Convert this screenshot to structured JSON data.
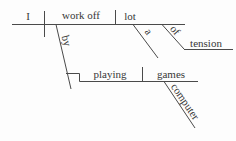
{
  "colors": {
    "line": "#4a4a4a",
    "text": "#383838",
    "background": "#fdfdfd"
  },
  "diagram": {
    "main_clause": {
      "subject": "I",
      "verb": "work off",
      "object": "lot"
    },
    "object_modifiers": {
      "article": "a",
      "preposition": "of",
      "prep_object": "tension"
    },
    "adverbial_phrase": {
      "preposition": "by",
      "gerund": "playing",
      "gerund_object": "games",
      "gerund_object_modifier": "computer"
    }
  }
}
